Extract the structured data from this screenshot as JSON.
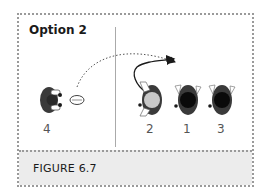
{
  "figure": {
    "title": "Option 2",
    "caption": "FIGURE 6.7"
  },
  "players": [
    {
      "label": "4",
      "head": "dark",
      "role": "passer"
    },
    {
      "label": "2",
      "head": "light",
      "role": "looping-runner"
    },
    {
      "label": "1",
      "head": "dark",
      "role": "receiver"
    },
    {
      "label": "3",
      "head": "dark",
      "role": "receiver"
    }
  ],
  "elements": {
    "ball": "rugby-ball",
    "pass_line": "dotted-arc-arrow",
    "run_line": "solid-curved-arrow"
  },
  "colors": {
    "border": "#9a9a9a",
    "caption_bg": "#ececec",
    "text": "#1a1a1a",
    "player_dark": "#3a3a3a",
    "player_light_head": "#c8c8c8"
  }
}
